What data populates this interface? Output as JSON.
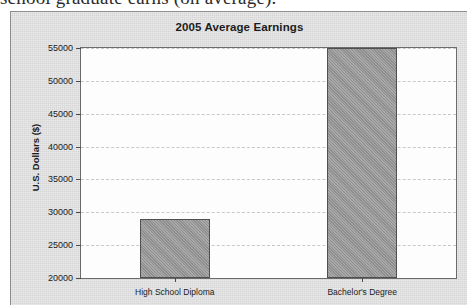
{
  "document": {
    "clipped_text": "school graduate earns (on average)."
  },
  "chart_data": {
    "type": "bar",
    "title": "2005 Average Earnings",
    "xlabel": "",
    "ylabel": "U.S. Dollars ($)",
    "categories": [
      "High School Diploma",
      "Bachelor's Degree"
    ],
    "values": [
      29000,
      55000
    ],
    "ylim": [
      20000,
      55000
    ],
    "yticks": [
      20000,
      25000,
      30000,
      35000,
      40000,
      45000,
      50000,
      55000
    ],
    "ytick_labels": [
      "20000",
      "25000",
      "30000",
      "35000",
      "40000",
      "45000",
      "50000",
      "55000"
    ],
    "grid": true,
    "legend": false,
    "colors": {
      "bar_fill": "#969696",
      "bar_border": "#4f4f4f",
      "plot_background": "#fdfdfd",
      "panel_background": "#d6d6d6",
      "gridline": "#c9c9c9",
      "axis": "#6b6b6b",
      "text": "#1c1c1c"
    }
  }
}
